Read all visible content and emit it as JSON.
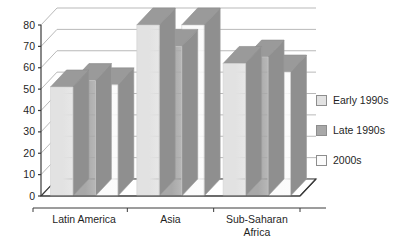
{
  "chart_data": {
    "type": "bar",
    "title": "",
    "subtitle": "",
    "xlabel": "",
    "ylabel": "",
    "ylim": [
      0,
      80
    ],
    "yticks": [
      0,
      10,
      20,
      30,
      40,
      50,
      60,
      70,
      80
    ],
    "grid": true,
    "legend_position": "right",
    "style": "3d-clustered-column",
    "categories": [
      "Latin America",
      "Asia",
      "Sub-Saharan Africa"
    ],
    "category_lines": [
      [
        "Latin America"
      ],
      [
        "Asia"
      ],
      [
        "Sub-Saharan",
        "Africa"
      ]
    ],
    "series": [
      {
        "name": "Early 1990s",
        "color": "#e2e2e2",
        "values": [
          51,
          80,
          62
        ]
      },
      {
        "name": "Late 1990s",
        "color": "#a8a8a8",
        "values": [
          54,
          70,
          65
        ]
      },
      {
        "name": "2000s",
        "color": "#fbfbfb",
        "values": [
          52,
          80,
          58
        ]
      }
    ]
  },
  "axis": {
    "tick_labels": [
      "0",
      "10",
      "20",
      "30",
      "40",
      "50",
      "60",
      "70",
      "80"
    ]
  },
  "legend": {
    "items": [
      {
        "label": "Early 1990s",
        "color": "#e2e2e2"
      },
      {
        "label": "Late 1990s",
        "color": "#a8a8a8"
      },
      {
        "label": "2000s",
        "color": "#fbfbfb"
      }
    ]
  },
  "colors": {
    "background": "#ffffff",
    "axis_line": "#3a3a3a",
    "gridline": "#b9b9b9",
    "text": "#1f1f1f",
    "floor": "#ffffff",
    "bar_top_shade": "#9a9a9a",
    "bar_side_shade": "#8f8f8f"
  }
}
